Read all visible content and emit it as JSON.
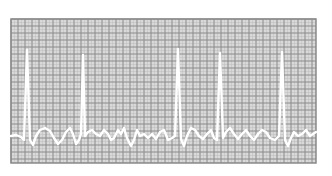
{
  "chart_data": {
    "type": "line",
    "title": "",
    "xlabel": "",
    "ylabel": "",
    "grid": true,
    "legend": null,
    "colors": {
      "background": "#ffffff",
      "paper": "#d9d9d9",
      "grid_minor": "#bdbdbd",
      "grid_major": "#8a8a8a",
      "trace": "#ffffff"
    },
    "plot_area": {
      "x": 11,
      "y": 19,
      "width": 305,
      "height": 144
    },
    "grid_cell_px": 7,
    "baseline_y": 133,
    "r_peaks": [
      {
        "x": 27,
        "y": 50
      },
      {
        "x": 83,
        "y": 55
      },
      {
        "x": 178,
        "y": 49
      },
      {
        "x": 220,
        "y": 53
      },
      {
        "x": 282,
        "y": 52
      }
    ],
    "trace_points": [
      [
        11,
        136
      ],
      [
        16,
        135
      ],
      [
        21,
        137
      ],
      [
        24,
        140
      ],
      [
        27,
        50
      ],
      [
        30,
        140
      ],
      [
        33,
        145
      ],
      [
        36,
        136
      ],
      [
        40,
        130
      ],
      [
        45,
        128
      ],
      [
        50,
        131
      ],
      [
        54,
        138
      ],
      [
        58,
        144
      ],
      [
        62,
        140
      ],
      [
        66,
        132
      ],
      [
        70,
        128
      ],
      [
        73,
        134
      ],
      [
        76,
        144
      ],
      [
        79,
        140
      ],
      [
        81,
        134
      ],
      [
        83,
        55
      ],
      [
        85,
        136
      ],
      [
        88,
        132
      ],
      [
        92,
        130
      ],
      [
        96,
        134
      ],
      [
        100,
        136
      ],
      [
        104,
        130
      ],
      [
        108,
        134
      ],
      [
        111,
        140
      ],
      [
        114,
        138
      ],
      [
        118,
        130
      ],
      [
        121,
        134
      ],
      [
        124,
        128
      ],
      [
        127,
        138
      ],
      [
        131,
        146
      ],
      [
        134,
        140
      ],
      [
        137,
        130
      ],
      [
        140,
        136
      ],
      [
        144,
        134
      ],
      [
        148,
        138
      ],
      [
        152,
        134
      ],
      [
        156,
        139
      ],
      [
        160,
        132
      ],
      [
        164,
        130
      ],
      [
        168,
        140
      ],
      [
        172,
        138
      ],
      [
        175,
        136
      ],
      [
        178,
        49
      ],
      [
        181,
        139
      ],
      [
        184,
        146
      ],
      [
        187,
        136
      ],
      [
        191,
        128
      ],
      [
        195,
        130
      ],
      [
        199,
        136
      ],
      [
        203,
        139
      ],
      [
        207,
        134
      ],
      [
        211,
        130
      ],
      [
        214,
        138
      ],
      [
        217,
        140
      ],
      [
        220,
        53
      ],
      [
        223,
        138
      ],
      [
        226,
        132
      ],
      [
        230,
        128
      ],
      [
        234,
        134
      ],
      [
        238,
        139
      ],
      [
        242,
        134
      ],
      [
        246,
        130
      ],
      [
        250,
        136
      ],
      [
        254,
        140
      ],
      [
        258,
        134
      ],
      [
        262,
        130
      ],
      [
        266,
        132
      ],
      [
        270,
        138
      ],
      [
        275,
        140
      ],
      [
        279,
        136
      ],
      [
        282,
        52
      ],
      [
        285,
        140
      ],
      [
        288,
        146
      ],
      [
        291,
        138
      ],
      [
        294,
        132
      ],
      [
        298,
        136
      ],
      [
        302,
        134
      ],
      [
        306,
        130
      ],
      [
        310,
        136
      ],
      [
        316,
        132
      ]
    ]
  }
}
